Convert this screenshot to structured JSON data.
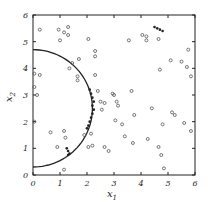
{
  "chart_data": {
    "type": "scatter",
    "title": "",
    "xlabel": "x1",
    "ylabel": "x2",
    "xlim": [
      0,
      6
    ],
    "ylim": [
      0,
      6
    ],
    "xticks": [
      0,
      1,
      2,
      3,
      4,
      5,
      6
    ],
    "yticks": [
      0,
      1,
      2,
      3,
      4,
      5,
      6
    ],
    "grid": false,
    "legend": null,
    "series": [
      {
        "name": "open-circle points",
        "marker": "circle-open",
        "points": [
          [
            0.25,
            5.45
          ],
          [
            0.95,
            5.45
          ],
          [
            1.15,
            5.35
          ],
          [
            1.3,
            5.55
          ],
          [
            1.3,
            5.25
          ],
          [
            1.0,
            5.05
          ],
          [
            2.05,
            5.1
          ],
          [
            1.35,
            4.0
          ],
          [
            1.7,
            4.35
          ],
          [
            1.45,
            4.2
          ],
          [
            0.25,
            3.75
          ],
          [
            0.05,
            3.8
          ],
          [
            0.15,
            3.0
          ],
          [
            0.05,
            3.3
          ],
          [
            1.65,
            3.7
          ],
          [
            1.65,
            3.55
          ],
          [
            3.55,
            5.05
          ],
          [
            4.65,
            5.1
          ],
          [
            4.05,
            5.25
          ],
          [
            4.2,
            5.2
          ],
          [
            4.2,
            5.05
          ],
          [
            2.3,
            4.65
          ],
          [
            2.3,
            4.45
          ],
          [
            5.75,
            4.7
          ],
          [
            2.3,
            3.75
          ],
          [
            5.1,
            4.3
          ],
          [
            5.5,
            4.25
          ],
          [
            5.7,
            4.05
          ],
          [
            4.7,
            3.95
          ],
          [
            5.85,
            3.7
          ],
          [
            3.65,
            3.15
          ],
          [
            2.5,
            2.75
          ],
          [
            2.65,
            2.7
          ],
          [
            2.55,
            2.45
          ],
          [
            2.95,
            3.05
          ],
          [
            3.0,
            3.0
          ],
          [
            3.1,
            2.75
          ],
          [
            3.15,
            2.6
          ],
          [
            2.4,
            3.15
          ],
          [
            4.4,
            2.5
          ],
          [
            5.15,
            2.35
          ],
          [
            5.25,
            2.25
          ],
          [
            3.75,
            2.25
          ],
          [
            3.3,
            1.9
          ],
          [
            3.05,
            2.05
          ],
          [
            4.8,
            1.9
          ],
          [
            5.6,
            1.95
          ],
          [
            5.85,
            1.65
          ],
          [
            3.4,
            1.45
          ],
          [
            4.25,
            1.35
          ],
          [
            3.7,
            1.2
          ],
          [
            4.65,
            1.05
          ],
          [
            2.65,
            1.05
          ],
          [
            2.8,
            0.9
          ],
          [
            4.75,
            0.75
          ],
          [
            0.05,
            2.0
          ],
          [
            0.65,
            1.6
          ],
          [
            1.15,
            1.65
          ],
          [
            1.2,
            1.4
          ],
          [
            0.9,
            1.05
          ],
          [
            1.9,
            1.5
          ],
          [
            2.15,
            1.55
          ],
          [
            2.05,
            1.05
          ],
          [
            2.2,
            1.1
          ],
          [
            1.15,
            0.2
          ],
          [
            4.85,
            0.25
          ]
        ]
      },
      {
        "name": "filled points (near boundary)",
        "marker": "dot",
        "points": [
          [
            2.1,
            3.2
          ],
          [
            2.15,
            3.05
          ],
          [
            2.2,
            2.9
          ],
          [
            2.25,
            2.75
          ],
          [
            2.2,
            2.6
          ],
          [
            2.25,
            2.45
          ],
          [
            2.2,
            2.3
          ],
          [
            2.15,
            2.15
          ],
          [
            2.1,
            2.0
          ],
          [
            2.05,
            1.85
          ],
          [
            2.0,
            1.75
          ],
          [
            1.25,
            1.0
          ],
          [
            1.3,
            0.9
          ],
          [
            1.35,
            0.8
          ],
          [
            1.3,
            0.75
          ],
          [
            4.5,
            5.55
          ],
          [
            4.6,
            5.5
          ],
          [
            4.7,
            5.45
          ],
          [
            4.8,
            5.4
          ]
        ]
      }
    ],
    "curves": [
      {
        "name": "decision boundary",
        "shape": "circular arc",
        "center": [
          0,
          2.5
        ],
        "radius": 2.2,
        "from": [
          0,
          4.7
        ],
        "to": [
          0,
          0.3
        ]
      }
    ]
  },
  "axes": {
    "x_label_main": "x",
    "x_label_sub": "1",
    "y_label_main": "x",
    "y_label_sub": "2",
    "x_tick_labels": [
      "0",
      "1",
      "2",
      "3",
      "4",
      "5",
      "6"
    ],
    "y_tick_labels": [
      "0",
      "1",
      "2",
      "3",
      "4",
      "5",
      "6"
    ]
  },
  "colors": {
    "ink": "#222222",
    "point": "#555555",
    "background": "#ffffff"
  }
}
